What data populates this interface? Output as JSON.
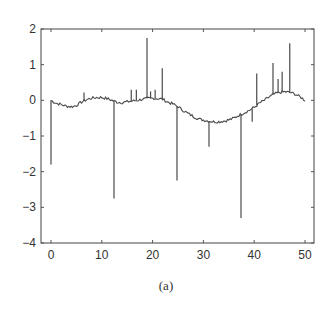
{
  "chart_data": {
    "type": "line",
    "title": "",
    "caption": "(a)",
    "xlabel": "",
    "ylabel": "",
    "xlim": [
      -2,
      51.5
    ],
    "ylim": [
      -4,
      2
    ],
    "xticks": [
      0,
      10,
      20,
      30,
      40,
      50
    ],
    "yticks": [
      2,
      1,
      0,
      -1,
      -2,
      -3,
      -4
    ],
    "grid": false,
    "legend": null,
    "line_color": "#4a4a4a",
    "baseline": {
      "x": [
        0,
        1,
        2,
        3,
        4,
        5,
        6,
        7,
        8,
        9,
        10,
        11,
        12,
        13,
        14,
        15,
        16,
        17,
        18,
        19,
        20,
        21,
        22,
        23,
        24,
        25,
        26,
        27,
        28,
        29,
        30,
        31,
        32,
        33,
        34,
        35,
        36,
        37,
        38,
        39,
        40,
        41,
        42,
        43,
        44,
        45,
        46,
        47,
        48,
        49,
        50
      ],
      "y": [
        0.0,
        -0.08,
        -0.12,
        -0.16,
        -0.18,
        -0.14,
        -0.05,
        0.02,
        0.06,
        0.08,
        0.08,
        0.05,
        0.0,
        -0.05,
        -0.06,
        -0.04,
        -0.02,
        0.0,
        0.03,
        0.05,
        0.06,
        0.05,
        0.03,
        -0.05,
        -0.1,
        -0.18,
        -0.28,
        -0.37,
        -0.45,
        -0.52,
        -0.55,
        -0.58,
        -0.6,
        -0.6,
        -0.58,
        -0.55,
        -0.5,
        -0.42,
        -0.35,
        -0.28,
        -0.2,
        -0.08,
        0.0,
        0.1,
        0.18,
        0.22,
        0.24,
        0.22,
        0.18,
        0.1,
        0.0
      ]
    },
    "spikes": [
      {
        "x": 0.0,
        "y": -1.8
      },
      {
        "x": 6.5,
        "y": 0.22
      },
      {
        "x": 12.4,
        "y": -2.75
      },
      {
        "x": 15.8,
        "y": 0.3
      },
      {
        "x": 16.8,
        "y": 0.3
      },
      {
        "x": 18.9,
        "y": 1.75
      },
      {
        "x": 19.6,
        "y": 0.25
      },
      {
        "x": 20.5,
        "y": 0.3
      },
      {
        "x": 21.9,
        "y": 0.9
      },
      {
        "x": 24.8,
        "y": -2.25
      },
      {
        "x": 29.0,
        "y": -0.5
      },
      {
        "x": 31.1,
        "y": -1.3
      },
      {
        "x": 37.4,
        "y": -3.3
      },
      {
        "x": 38.6,
        "y": -0.3
      },
      {
        "x": 39.6,
        "y": -0.6
      },
      {
        "x": 40.5,
        "y": 0.75
      },
      {
        "x": 43.7,
        "y": 1.05
      },
      {
        "x": 44.7,
        "y": 0.6
      },
      {
        "x": 45.5,
        "y": 0.8
      },
      {
        "x": 47.0,
        "y": 1.6
      }
    ]
  }
}
